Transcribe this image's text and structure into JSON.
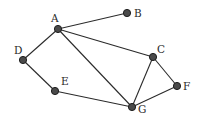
{
  "diagram": {
    "type": "undirected-graph",
    "nodes": [
      {
        "id": "A",
        "label": "A",
        "x": 58,
        "y": 29,
        "lx": 51,
        "ly": 22
      },
      {
        "id": "B",
        "label": "B",
        "x": 127,
        "y": 13,
        "lx": 134,
        "ly": 17
      },
      {
        "id": "C",
        "label": "C",
        "x": 153,
        "y": 57,
        "lx": 157,
        "ly": 53
      },
      {
        "id": "D",
        "label": "D",
        "x": 23,
        "y": 60,
        "lx": 14,
        "ly": 54
      },
      {
        "id": "E",
        "label": "E",
        "x": 55,
        "y": 91,
        "lx": 61,
        "ly": 85
      },
      {
        "id": "F",
        "label": "F",
        "x": 177,
        "y": 86,
        "lx": 183,
        "ly": 90
      },
      {
        "id": "G",
        "label": "G",
        "x": 132,
        "y": 107,
        "lx": 138,
        "ly": 113
      }
    ],
    "edges": [
      [
        "A",
        "B"
      ],
      [
        "A",
        "C"
      ],
      [
        "A",
        "D"
      ],
      [
        "A",
        "G"
      ],
      [
        "D",
        "E"
      ],
      [
        "E",
        "G"
      ],
      [
        "C",
        "G"
      ],
      [
        "C",
        "F"
      ],
      [
        "F",
        "G"
      ]
    ],
    "colors": {
      "node_fill": "#4a4a4a",
      "edge": "#2a2a2a",
      "background": "#ffffff"
    }
  }
}
